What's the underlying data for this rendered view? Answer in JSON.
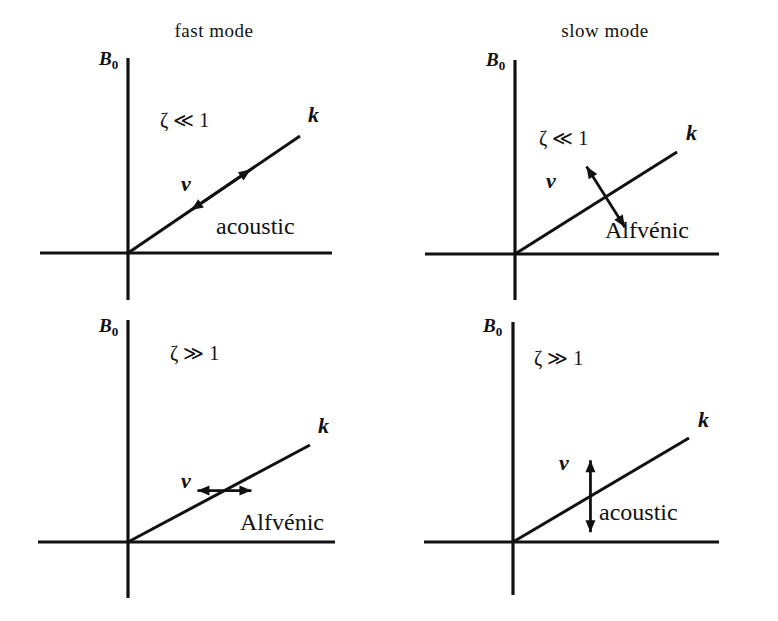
{
  "figure": {
    "title": "",
    "background_color": "#ffffff",
    "ink_color": "#111111",
    "width": 778,
    "height": 621
  },
  "chart_data": {
    "type": "diagram",
    "panels": [
      {
        "id": "fast-small-zeta",
        "position": "top-left",
        "mode_title": "fast mode",
        "show_mode_title": true,
        "vertical_axis_label": "B",
        "vertical_axis_subscript": "0",
        "horizontal_axis_label": "",
        "regime": "ζ ≪ 1",
        "wavevector_label": "k",
        "velocity_label": "v",
        "velocity_orientation": "parallel",
        "wave_type": "acoustic",
        "geometry": {
          "origin_x": 128,
          "origin_y": 253,
          "x_axis_start": 40,
          "x_axis_end": 332,
          "y_axis_top": 58,
          "y_axis_bottom": 300,
          "k_tip_x": 300,
          "k_tip_y": 136,
          "k_label_x": 308,
          "k_label_y": 122,
          "regime_x": 160,
          "regime_y": 127,
          "mode_title_x": 214,
          "mode_title_y": 37,
          "axis_label_x": 99,
          "axis_label_y": 65,
          "v_label_x": 186,
          "v_label_y": 191,
          "v_center_t": 0.54,
          "v_half_length": 36,
          "type_label_x": 216,
          "type_label_y": 234
        }
      },
      {
        "id": "slow-small-zeta",
        "position": "top-right",
        "mode_title": "slow mode",
        "show_mode_title": true,
        "vertical_axis_label": "B",
        "vertical_axis_subscript": "0",
        "horizontal_axis_label": "",
        "regime": "ζ ≪ 1",
        "wavevector_label": "k",
        "velocity_label": "v",
        "velocity_orientation": "perpendicular",
        "wave_type": "Alfvénic",
        "geometry": {
          "origin_x": 126,
          "origin_y": 254,
          "x_axis_start": 36,
          "x_axis_end": 330,
          "y_axis_top": 60,
          "y_axis_bottom": 300,
          "k_tip_x": 288,
          "k_tip_y": 152,
          "k_label_x": 297,
          "k_label_y": 140,
          "regime_x": 150,
          "regime_y": 145,
          "mode_title_x": 216,
          "mode_title_y": 37,
          "axis_label_x": 97,
          "axis_label_y": 66,
          "v_label_x": 162,
          "v_label_y": 188,
          "v_center_t": 0.56,
          "v_half_length": 36,
          "type_label_x": 216,
          "type_label_y": 238
        }
      },
      {
        "id": "fast-large-zeta",
        "position": "bottom-left",
        "mode_title": "",
        "show_mode_title": false,
        "vertical_axis_label": "B",
        "vertical_axis_subscript": "0",
        "horizontal_axis_label": "",
        "regime": "ζ ≫ 1",
        "wavevector_label": "k",
        "velocity_label": "v",
        "velocity_orientation": "horizontal",
        "wave_type": "Alfvénic",
        "geometry": {
          "origin_x": 128,
          "origin_y": 232,
          "x_axis_start": 38,
          "x_axis_end": 335,
          "y_axis_top": 10,
          "y_axis_bottom": 288,
          "k_tip_x": 310,
          "k_tip_y": 135,
          "k_label_x": 318,
          "k_label_y": 123,
          "regime_x": 170,
          "regime_y": 50,
          "mode_title_x": 214,
          "mode_title_y": 0,
          "axis_label_x": 99,
          "axis_label_y": 22,
          "v_label_x": 186,
          "v_label_y": 178,
          "v_center_t": 0.53,
          "v_half_length": 27,
          "type_label_x": 240,
          "type_label_y": 220
        }
      },
      {
        "id": "slow-large-zeta",
        "position": "bottom-right",
        "mode_title": "",
        "show_mode_title": false,
        "vertical_axis_label": "B",
        "vertical_axis_subscript": "0",
        "horizontal_axis_label": "",
        "regime": "ζ ≫ 1",
        "wavevector_label": "k",
        "velocity_label": "v",
        "velocity_orientation": "vertical",
        "wave_type": "acoustic",
        "geometry": {
          "origin_x": 124,
          "origin_y": 232,
          "x_axis_start": 35,
          "x_axis_end": 330,
          "y_axis_top": 12,
          "y_axis_bottom": 285,
          "k_tip_x": 300,
          "k_tip_y": 128,
          "k_label_x": 309,
          "k_label_y": 117,
          "regime_x": 145,
          "regime_y": 55,
          "mode_title_x": 216,
          "mode_title_y": 0,
          "axis_label_x": 94,
          "axis_label_y": 22,
          "v_label_x": 175,
          "v_label_y": 160,
          "v_center_t": 0.44,
          "v_half_length": 36,
          "type_label_x": 210,
          "type_label_y": 210
        }
      }
    ]
  }
}
